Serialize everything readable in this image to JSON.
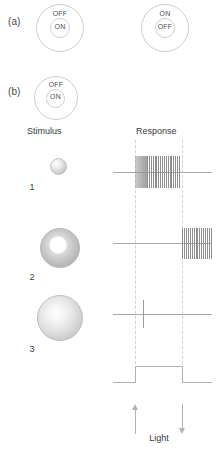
{
  "figure": {
    "panel_a": {
      "label": "(a)",
      "receptive_fields": [
        {
          "name": "on-center-receptive-field",
          "surround_label": "OFF",
          "center_label": "ON"
        },
        {
          "name": "off-center-receptive-field",
          "surround_label": "ON",
          "center_label": "OFF"
        }
      ]
    },
    "panel_b": {
      "label": "(b)",
      "receptive_field": {
        "name": "on-center-receptive-field",
        "surround_label": "OFF",
        "center_label": "ON"
      },
      "column_headings": {
        "stimulus": "Stimulus",
        "response": "Response"
      },
      "rows": [
        {
          "number": "1",
          "stimulus_shape": "small-center-spot"
        },
        {
          "number": "2",
          "stimulus_shape": "surround-annulus"
        },
        {
          "number": "3",
          "stimulus_shape": "large-full-field-spot"
        }
      ],
      "light_trace": {
        "label": "Light",
        "onset_marker": "up-arrow",
        "offset_marker": "down-arrow"
      }
    }
  },
  "chart_data": {
    "type": "raster",
    "xlabel": "",
    "ylabel": "",
    "time_axis": {
      "light_on": 135,
      "light_off": 182,
      "trace_start": 113,
      "trace_end": 212
    },
    "series": [
      {
        "name": "response-1",
        "row": "1",
        "description": "Vigorous ON response: sustained high-frequency burst beginning at light onset and ending at light offset",
        "burst_windows": [
          {
            "start": 135,
            "end": 145,
            "spikes": 7,
            "density": "dense"
          },
          {
            "start": 146,
            "end": 180,
            "spikes": 18,
            "density": "regular"
          }
        ],
        "single_spikes": []
      },
      {
        "name": "response-2",
        "row": "2",
        "description": "OFF response: burst begins at light offset and continues after the light is extinguished",
        "burst_windows": [
          {
            "start": 182,
            "end": 212,
            "spikes": 16,
            "density": "regular"
          }
        ],
        "single_spikes": []
      },
      {
        "name": "response-3",
        "row": "3",
        "description": "Weak response to diffuse full-field illumination: a single spike shortly after light onset",
        "burst_windows": [],
        "single_spikes": [
          143
        ]
      }
    ],
    "stimulus_trace": {
      "name": "light",
      "type": "square-pulse",
      "baseline": 0,
      "high": 1,
      "on_at": 135,
      "off_at": 182
    }
  }
}
